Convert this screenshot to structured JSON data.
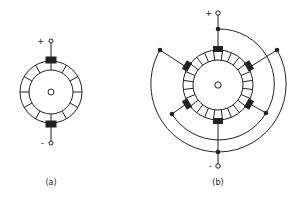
{
  "figure": {
    "colors": {
      "line": "#222222",
      "background": "#ffffff"
    },
    "panels": [
      {
        "id": "a",
        "label": "(a)",
        "plus_sign": "+",
        "minus_sign": "-",
        "commutator_segments": 12,
        "brushes": 2
      },
      {
        "id": "b",
        "label": "(b)",
        "plus_sign": "+",
        "minus_sign": "-",
        "commutator_segments": 24,
        "brushes": 6
      }
    ]
  }
}
